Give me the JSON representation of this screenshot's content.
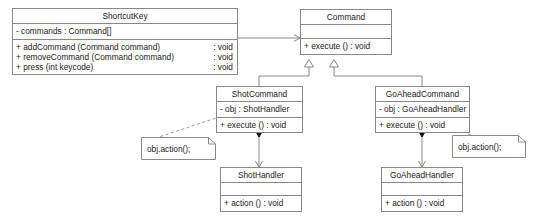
{
  "diagram": {
    "type": "uml-class-diagram",
    "colors": {
      "background": "#ffffff",
      "line": "#888888",
      "text": "#1a1a1a"
    }
  },
  "classes": {
    "shortcut_key": {
      "name": "ShortcutKey",
      "attributes": [
        {
          "text": "- commands : Command[]"
        }
      ],
      "operations": [
        {
          "signature": "+ addCommand (Command command)",
          "returns": ": void"
        },
        {
          "signature": "+ removeCommand (Command command)",
          "returns": ": void"
        },
        {
          "signature": "+ press (int keycode)",
          "returns": ": void"
        }
      ]
    },
    "command": {
      "name": "Command",
      "attributes": [],
      "operations": [
        {
          "signature": "+ execute () : void",
          "returns": ""
        }
      ]
    },
    "shot_command": {
      "name": "ShotCommand",
      "attributes": [
        {
          "text": "- obj  : ShotHandler"
        }
      ],
      "operations": [
        {
          "signature": "+ execute () : void",
          "returns": ""
        }
      ]
    },
    "go_ahead_command": {
      "name": "GoAheadCommand",
      "attributes": [
        {
          "text": "- obj : GoAheadHandler"
        }
      ],
      "operations": [
        {
          "signature": "+ execute () : void",
          "returns": ""
        }
      ]
    },
    "shot_handler": {
      "name": "ShotHandler",
      "attributes": [],
      "operations": [
        {
          "signature": "+ action () : void",
          "returns": ""
        }
      ]
    },
    "go_ahead_handler": {
      "name": "GoAheadHandler",
      "attributes": [],
      "operations": [
        {
          "signature": "+ action () : void",
          "returns": ""
        }
      ]
    }
  },
  "notes": {
    "shot_note": {
      "text": "obj.action();"
    },
    "go_ahead_note": {
      "text": "obj.action();"
    }
  },
  "relationships": [
    {
      "name": "shortcutkey-aggregates-command",
      "from": "ShortcutKey",
      "to": "Command",
      "kind": "aggregation"
    },
    {
      "name": "shotcommand-inherits-command",
      "from": "ShotCommand",
      "to": "Command",
      "kind": "generalization"
    },
    {
      "name": "goaheadcommand-inherits-command",
      "from": "GoAheadCommand",
      "to": "Command",
      "kind": "generalization"
    },
    {
      "name": "shotcommand-composes-shothandler",
      "from": "ShotCommand",
      "to": "ShotHandler",
      "kind": "composition"
    },
    {
      "name": "goaheadcommand-composes-goaheadhandler",
      "from": "GoAheadCommand",
      "to": "GoAheadHandler",
      "kind": "composition"
    },
    {
      "name": "shot-note-anchor",
      "from": "obj.action(); note",
      "to": "ShotCommand execute",
      "kind": "note-link"
    },
    {
      "name": "goahead-note-anchor",
      "from": "obj.action(); note",
      "to": "GoAheadCommand execute",
      "kind": "note-link"
    }
  ]
}
